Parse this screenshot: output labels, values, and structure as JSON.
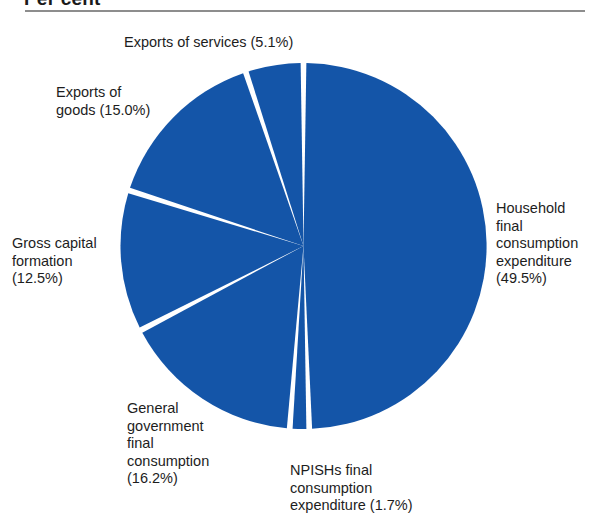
{
  "header": {
    "title": "Per cent"
  },
  "chart_data": {
    "type": "pie",
    "title": "Per cent",
    "unit": "percent",
    "legend_position": "callout-labels",
    "slice_color": "#1455a8",
    "gap_color": "#ffffff",
    "categories": [
      "Household final consumption expenditure",
      "NPISHs final consumption expenditure",
      "General government final consumption",
      "Gross capital formation",
      "Exports of goods",
      "Exports of services"
    ],
    "values": [
      49.5,
      1.7,
      16.2,
      12.5,
      15.0,
      5.1
    ],
    "slices": [
      {
        "name": "household",
        "label": "Household\nfinal\nconsumption\nexpenditure\n(49.5%)",
        "category": "Household final consumption expenditure",
        "value": 49.5,
        "value_text": "(49.5%)"
      },
      {
        "name": "npish",
        "label": "NPISHs final\nconsumption\nexpenditure (1.7%)",
        "category": "NPISHs final consumption expenditure",
        "value": 1.7,
        "value_text": "(1.7%)"
      },
      {
        "name": "general-government",
        "label": "General\ngovernment\nfinal\nconsumption\n(16.2%)",
        "category": "General government final consumption",
        "value": 16.2,
        "value_text": "(16.2%)"
      },
      {
        "name": "gross-capital-formation",
        "label": "Gross capital\nformation\n(12.5%)",
        "category": "Gross capital formation",
        "value": 12.5,
        "value_text": "(12.5%)"
      },
      {
        "name": "exports-of-goods",
        "label": "Exports of\ngoods (15.0%)",
        "category": "Exports of goods",
        "value": 15.0,
        "value_text": "(15.0%)"
      },
      {
        "name": "exports-of-services",
        "label": "Exports of services (5.1%)",
        "category": "Exports of services",
        "value": 5.1,
        "value_text": "(5.1%)"
      }
    ]
  },
  "geometry": {
    "center_x": 303.5,
    "center_y": 246,
    "radius": 183
  }
}
